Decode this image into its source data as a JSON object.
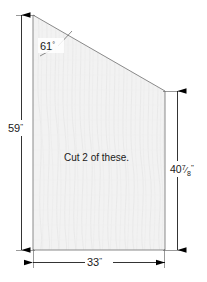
{
  "figure": {
    "type": "technical-drawing",
    "note": "Cut 2 of these.",
    "shape": {
      "name": "right-trapezoid-panel",
      "fill_color": "#f2f2f2",
      "outline_color": "#8a8a8a",
      "texture": "wood-grain"
    },
    "dimensions": {
      "left_height": "59\"",
      "right_height_whole": "40",
      "right_height_fraction_numerator": "7",
      "right_height_fraction_denominator": "8",
      "right_height_unit": "\"",
      "right_height_full": "40 7/8\"",
      "bottom_width": "33\"",
      "top_angle": "61°"
    },
    "labels": {
      "angle": "61",
      "angle_unit": "°",
      "left": "59",
      "left_unit": "\"",
      "bottom": "33",
      "bottom_unit": "\""
    },
    "colors": {
      "background": "#ffffff",
      "dimension_line": "#000000",
      "text": "#1a1a1a",
      "panel_fill": "#f2f2f2",
      "panel_edge": "#8a8a8a",
      "grain": "#e2e2e2"
    }
  }
}
